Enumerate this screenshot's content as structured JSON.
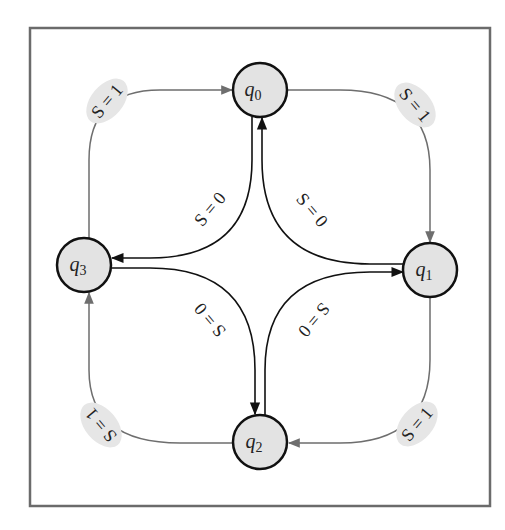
{
  "diagram": {
    "type": "state-diagram",
    "frame": {
      "x": 30,
      "y": 28,
      "width": 460,
      "height": 478,
      "stroke": "#6b6b6b"
    },
    "colors": {
      "state_fill": "#e3e3e3",
      "state_stroke": "#111111",
      "outer_edge": "#6e6e6e",
      "inner_edge": "#111111",
      "label_bubble": "#e6e6e6"
    },
    "states": [
      {
        "id": "q0",
        "base": "q",
        "sub": "0",
        "cx": 260,
        "cy": 90
      },
      {
        "id": "q1",
        "base": "q",
        "sub": "1",
        "cx": 430,
        "cy": 270
      },
      {
        "id": "q2",
        "base": "q",
        "sub": "2",
        "cx": 260,
        "cy": 442
      },
      {
        "id": "q3",
        "base": "q",
        "sub": "3",
        "cx": 84,
        "cy": 265
      }
    ],
    "transitions": [
      {
        "from": "q3",
        "to": "q0",
        "label": "S = 1"
      },
      {
        "from": "q0",
        "to": "q1",
        "label": "S = 1"
      },
      {
        "from": "q1",
        "to": "q2",
        "label": "S = 1"
      },
      {
        "from": "q2",
        "to": "q3",
        "label": "S = 1"
      },
      {
        "from": "q0",
        "to": "q3",
        "label": "S = 0"
      },
      {
        "from": "q1",
        "to": "q0",
        "label": "S = 0"
      },
      {
        "from": "q3",
        "to": "q2",
        "label": "S = 0"
      },
      {
        "from": "q2",
        "to": "q1",
        "label": "S = 0"
      }
    ]
  }
}
